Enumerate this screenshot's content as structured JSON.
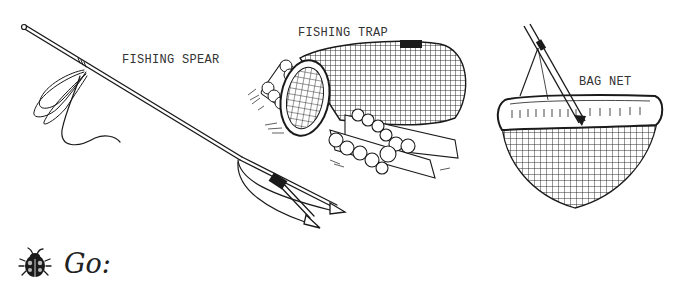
{
  "illustrations": [
    {
      "id": "spear",
      "label": "FISHING SPEAR"
    },
    {
      "id": "trap",
      "label": "FISHING TRAP"
    },
    {
      "id": "net",
      "label": "BAG NET"
    }
  ],
  "prompt": {
    "icon": "ladybug-icon",
    "text": "Go:"
  },
  "colors": {
    "ink": "#1a1a1a",
    "background": "#ffffff"
  }
}
